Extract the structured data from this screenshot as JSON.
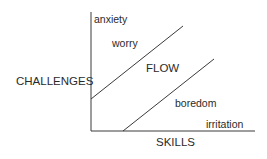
{
  "diagram": {
    "type": "flow-channel",
    "axes": {
      "y_label": "CHALLENGES",
      "x_label": "SKILLS"
    },
    "regions": {
      "anxiety": "anxiety",
      "worry": "worry",
      "flow": "FLOW",
      "boredom": "boredom",
      "irritation": "irritation"
    },
    "colors": {
      "line": "#3a3a3a",
      "text": "#2a2a2a",
      "background": "#ffffff"
    }
  }
}
